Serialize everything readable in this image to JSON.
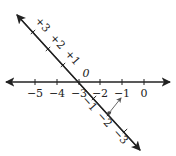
{
  "horizontal_axis": {
    "y": 82,
    "x_start": 6,
    "x_end": 170,
    "ticks": [
      {
        "x": 35,
        "label": "−5"
      },
      {
        "x": 57,
        "label": "−4"
      },
      {
        "x": 79,
        "label": "−3"
      },
      {
        "x": 100,
        "label": "−2"
      },
      {
        "x": 122,
        "label": "−1"
      },
      {
        "x": 144,
        "label": "0"
      }
    ]
  },
  "diagonal_axis": {
    "start": [
      17,
      15
    ],
    "end": [
      140,
      150
    ],
    "ticks": [
      {
        "x": 33,
        "y": 32,
        "label": "+3"
      },
      {
        "x": 48,
        "y": 49,
        "label": "+2"
      },
      {
        "x": 63,
        "y": 65,
        "label": "+1"
      },
      {
        "x": 79,
        "y": 82,
        "label": "0"
      },
      {
        "x": 94,
        "y": 98,
        "label": "−1"
      },
      {
        "x": 109,
        "y": 114,
        "label": "−2"
      },
      {
        "x": 125,
        "y": 131,
        "label": "−3"
      }
    ]
  },
  "mapping_point": {
    "from": [
      109,
      113
    ],
    "to": [
      121,
      98
    ]
  },
  "colors": {
    "line": "#222222",
    "arrow": "#555555"
  }
}
